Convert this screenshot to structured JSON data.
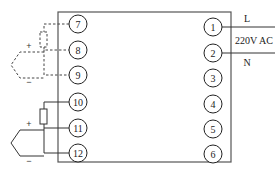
{
  "diagram": {
    "colors": {
      "line": "#333333",
      "box": "#555555",
      "background": "#ffffff"
    },
    "terminals_left": [
      {
        "id": "7",
        "label": "7"
      },
      {
        "id": "8",
        "label": "8"
      },
      {
        "id": "9",
        "label": "9"
      },
      {
        "id": "10",
        "label": "10"
      },
      {
        "id": "11",
        "label": "11"
      },
      {
        "id": "12",
        "label": "12"
      }
    ],
    "terminals_right": [
      {
        "id": "1",
        "label": "1"
      },
      {
        "id": "2",
        "label": "2"
      },
      {
        "id": "3",
        "label": "3"
      },
      {
        "id": "4",
        "label": "4"
      },
      {
        "id": "5",
        "label": "5"
      },
      {
        "id": "6",
        "label": "6"
      }
    ],
    "power": {
      "line_label": "L",
      "voltage_label": "220V AC",
      "neutral_label": "N"
    },
    "sensor_top": {
      "plus": "+",
      "minus": "−",
      "style": "dashed"
    },
    "sensor_bottom": {
      "plus": "+",
      "minus": "−",
      "style": "solid"
    }
  }
}
